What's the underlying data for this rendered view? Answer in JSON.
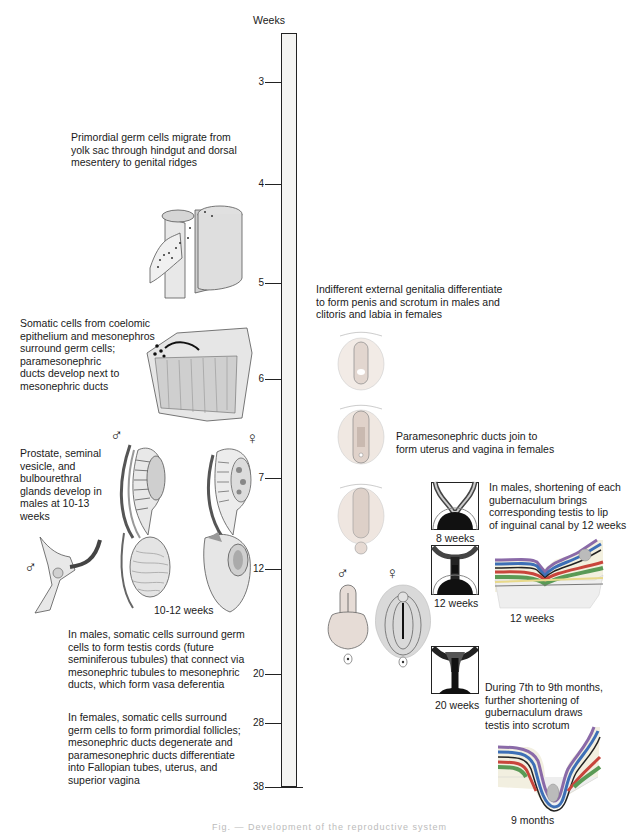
{
  "figure": {
    "axis_title": "Weeks",
    "timeline_ticks": [
      {
        "label": "3",
        "y": 82
      },
      {
        "label": "4",
        "y": 184
      },
      {
        "label": "5",
        "y": 283
      },
      {
        "label": "6",
        "y": 379
      },
      {
        "label": "7",
        "y": 478
      },
      {
        "label": "12",
        "y": 569
      },
      {
        "label": "20",
        "y": 674
      },
      {
        "label": "28",
        "y": 723
      },
      {
        "label": "38",
        "y": 787
      }
    ],
    "left_annotations": {
      "primordial": "Primordial germ cells migrate from\nyolk sac through hindgut and dorsal\nmesentery to genital ridges",
      "somatic": "Somatic cells from coelomic\nepithelium and mesonephros\nsurround germ cells;\nparamesonephric\nducts develop next to\nmesonephric ducts",
      "prostate": "Prostate, seminal\nvesicle, and\nbulbourethral\nglands develop in\nmales at 10-13\nweeks",
      "males_testis": "In males, somatic cells surround germ\ncells to form testis cords (future\nseminiferous tubules) that connect via\nmesonephric tubules to mesonephric\nducts, which form vasa deferentia",
      "females_follicles": "In females, somatic cells surround\ngerm cells to form primordial follicles;\nmesonephric ducts degenerate and\nparamesonephric ducts differentiate\ninto Fallopian tubes, uterus, and\nsuperior vagina"
    },
    "right_annotations": {
      "external_genitalia": "Indifferent external genitalia differentiate\nto form penis and scrotum in males and\nclitoris and labia in females",
      "paramesonephric_join": "Paramesonephric ducts join to\nform uterus and vagina in females",
      "gubernaculum_12": "In males, shortening of each\ngubernaculum brings\ncorresponding testis to lip\nof inguinal canal by 12 weeks",
      "gubernaculum_9m": "During 7th to 9th months,\nfurther shortening of\ngubernaculum draws\ntestis into scrotum"
    },
    "image_labels": {
      "ten_twelve_weeks": "10-12 weeks",
      "eight_weeks": "8 weeks",
      "twelve_weeks_box": "12 weeks",
      "twelve_weeks_section": "12 weeks",
      "twenty_weeks": "20 weeks",
      "nine_months": "9 months"
    },
    "symbols": {
      "male": "♂",
      "female": "♀"
    },
    "colors": {
      "timeline_fill": "#f4f4f2",
      "tissue_gray": "#d9d9d9",
      "layer_blue": "#3d6fb6",
      "layer_red": "#c8453c",
      "layer_green": "#5a9a55",
      "layer_purple": "#8a6aa8",
      "layer_yellow": "#e8d98a",
      "genital_pink": "#e9cfc4"
    },
    "caption": "Fig. — Development of the reproductive system"
  }
}
